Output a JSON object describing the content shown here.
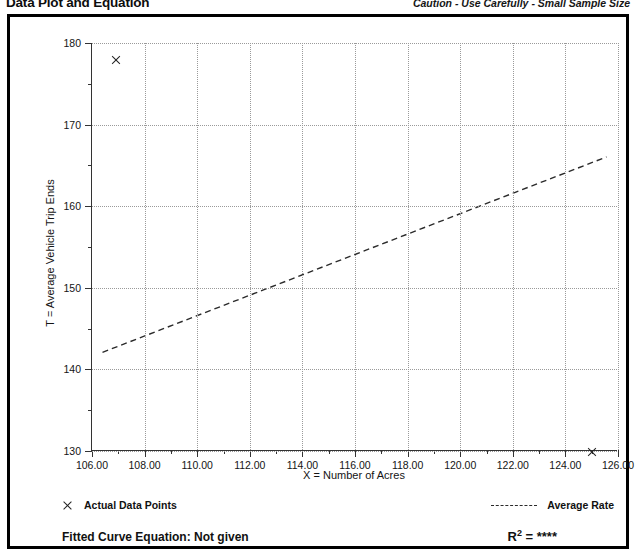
{
  "header": {
    "title": "Data Plot and Equation",
    "caution": "Caution - Use Carefully - Small Sample Size"
  },
  "legend": {
    "data_points_label": "Actual Data Points",
    "average_rate_label": "Average Rate",
    "data_point_marker": "x-marker-icon",
    "average_rate_marker": "dashed-line-icon"
  },
  "equation": {
    "fitted_label": "Fitted Curve Equation:  Not given",
    "r2_symbol": "R",
    "r2_exponent": "2",
    "r2_value": "= ****"
  },
  "chart_data": {
    "type": "scatter",
    "title": "Data Plot and Equation",
    "xlabel": "X = Number of Acres",
    "ylabel": "T = Average Vehicle Trip Ends",
    "xlim": [
      106,
      126
    ],
    "ylim": [
      130,
      180
    ],
    "xticks": [
      "106.00",
      "108.00",
      "110.00",
      "112.00",
      "114.00",
      "116.00",
      "118.00",
      "120.00",
      "122.00",
      "124.00",
      "126.00"
    ],
    "xtick_values": [
      106,
      108,
      110,
      112,
      114,
      116,
      118,
      120,
      122,
      124,
      126
    ],
    "x_minor_step": 1,
    "yticks": [
      "180",
      "170",
      "160",
      "150",
      "140",
      "130"
    ],
    "ytick_values": [
      180,
      170,
      160,
      150,
      140,
      130
    ],
    "y_minor_step": 5,
    "grid": true,
    "legend_position": "below-plot",
    "series": [
      {
        "name": "Actual Data Points",
        "type": "scatter",
        "marker": "x",
        "points": [
          {
            "x": 106.9,
            "y": 178.0
          },
          {
            "x": 125.0,
            "y": 130.0
          }
        ]
      },
      {
        "name": "Average Rate",
        "type": "line",
        "style": "dashed",
        "points": [
          {
            "x": 106.4,
            "y": 142.0
          },
          {
            "x": 125.6,
            "y": 166.0
          }
        ]
      }
    ]
  }
}
